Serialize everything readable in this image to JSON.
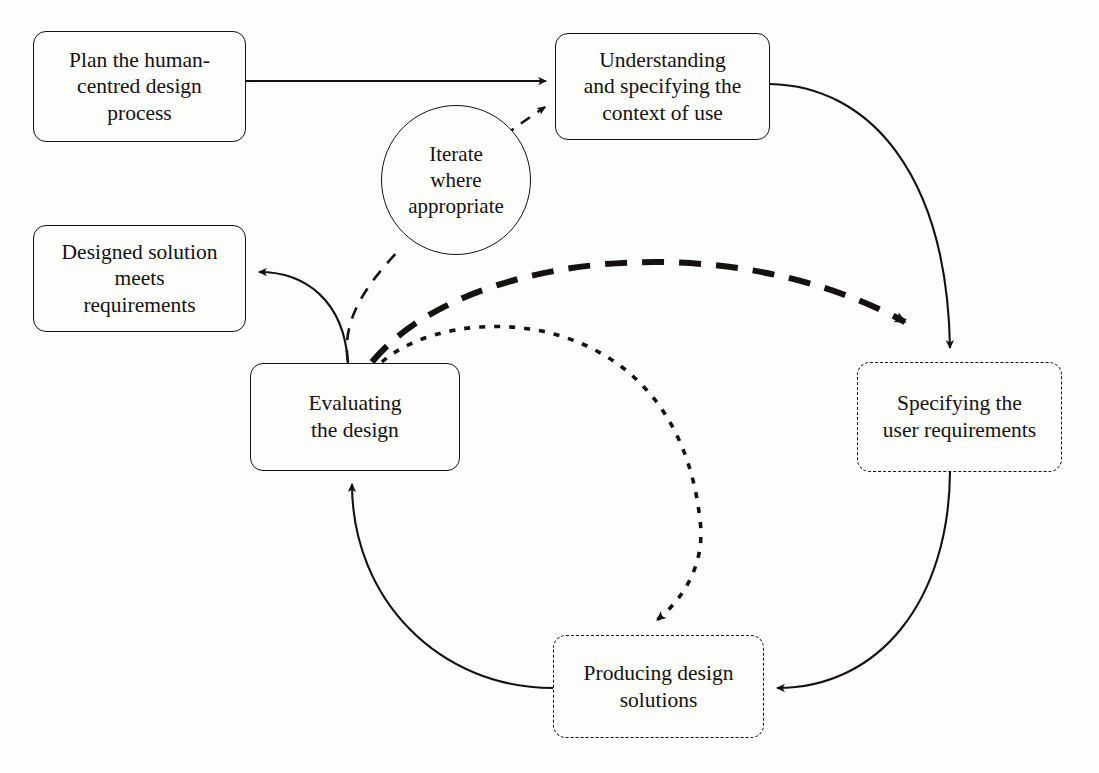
{
  "diagram": {
    "background_color": "#fdfdfc",
    "line_color": "#14110f",
    "nodes": [
      {
        "id": "plan",
        "label": "Plan the human-\ncentred design\nprocess",
        "shape": "rounded-rectangle",
        "border_style": "solid",
        "x": 33,
        "y": 31,
        "w": 213,
        "h": 111
      },
      {
        "id": "understanding",
        "label": "Understanding\nand specifying the\ncontext of use",
        "shape": "rounded-rectangle",
        "border_style": "solid",
        "x": 555,
        "y": 33,
        "w": 215,
        "h": 107
      },
      {
        "id": "iterate",
        "label": "Iterate\nwhere\nappropriate",
        "shape": "circle",
        "border_style": "solid",
        "x": 381,
        "y": 105,
        "w": 150,
        "h": 150
      },
      {
        "id": "designed",
        "label": "Designed solution\nmeets\nrequirements",
        "shape": "rounded-rectangle",
        "border_style": "solid",
        "x": 33,
        "y": 225,
        "w": 213,
        "h": 107
      },
      {
        "id": "specifying",
        "label": "Specifying the\nuser requirements",
        "shape": "rounded-rectangle",
        "border_style": "dashed",
        "x": 857,
        "y": 362,
        "w": 205,
        "h": 110
      },
      {
        "id": "evaluating",
        "label": "Evaluating\nthe design",
        "shape": "rounded-rectangle",
        "border_style": "solid",
        "x": 250,
        "y": 363,
        "w": 210,
        "h": 108
      },
      {
        "id": "producing",
        "label": "Producing design\nsolutions",
        "shape": "rounded-rectangle",
        "border_style": "dashed",
        "x": 553,
        "y": 635,
        "w": 211,
        "h": 103
      }
    ],
    "edges": [
      {
        "id": "plan-to-understanding",
        "from": "plan",
        "to": "understanding",
        "style": "solid",
        "weight": "thin",
        "arrow": true
      },
      {
        "id": "iterate-to-understanding",
        "from": "iterate",
        "to": "understanding",
        "style": "dashed",
        "weight": "thin",
        "arrow": true
      },
      {
        "id": "understanding-to-specifying",
        "from": "understanding",
        "to": "specifying",
        "style": "solid",
        "weight": "thin",
        "arrow": true
      },
      {
        "id": "specifying-to-producing",
        "from": "specifying",
        "to": "producing",
        "style": "solid",
        "weight": "thin",
        "arrow": true
      },
      {
        "id": "producing-to-evaluating",
        "from": "producing",
        "to": "evaluating",
        "style": "solid",
        "weight": "thin",
        "arrow": true
      },
      {
        "id": "evaluating-to-designed",
        "from": "evaluating",
        "to": "designed",
        "style": "solid",
        "weight": "thin",
        "arrow": true
      },
      {
        "id": "evaluating-to-specifying",
        "from": "evaluating",
        "to": "specifying",
        "style": "dashed",
        "weight": "thick",
        "arrow": true
      },
      {
        "id": "evaluating-to-producing",
        "from": "evaluating",
        "to": "producing",
        "style": "dotted",
        "weight": "medium",
        "arrow": true
      },
      {
        "id": "evaluating-to-iterate",
        "from": "evaluating",
        "to": "iterate",
        "style": "dashed",
        "weight": "thin",
        "arrow": false
      }
    ]
  }
}
